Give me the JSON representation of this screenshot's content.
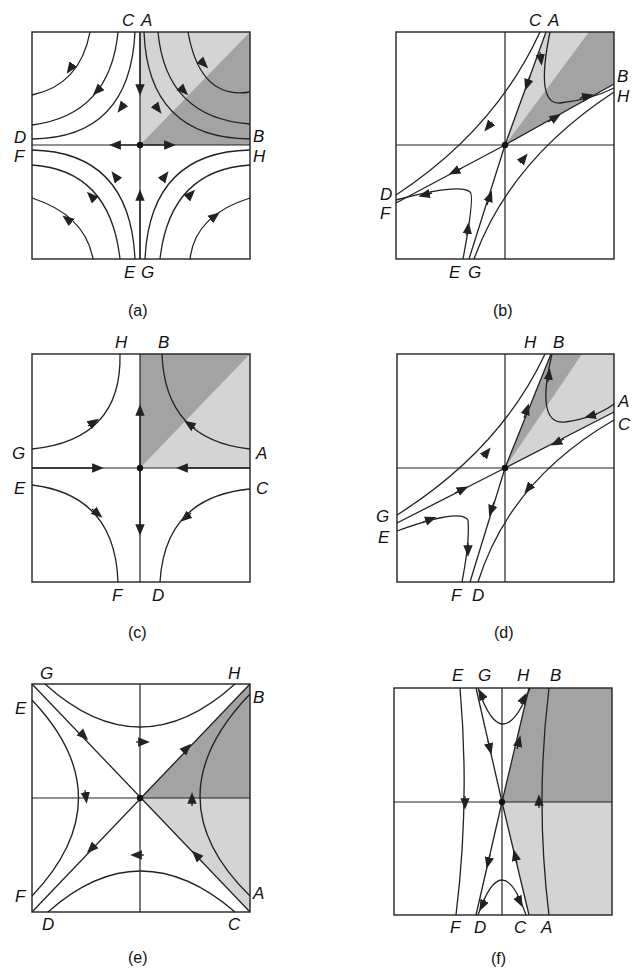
{
  "figure": {
    "panels": [
      {
        "id": "a",
        "caption": "(a)",
        "labels": {
          "top": [
            "C",
            "A"
          ],
          "left": [
            "D",
            "F"
          ],
          "right": [
            "B",
            "H"
          ],
          "bottom": [
            "E",
            "G"
          ]
        }
      },
      {
        "id": "b",
        "caption": "(b)",
        "labels": {
          "top": [
            "C",
            "A"
          ],
          "left": [
            "D",
            "F"
          ],
          "right": [
            "B",
            "H"
          ],
          "bottom": [
            "E",
            "G"
          ]
        }
      },
      {
        "id": "c",
        "caption": "(c)",
        "labels": {
          "top": [
            "H",
            "B"
          ],
          "left": [
            "G",
            "E"
          ],
          "right": [
            "A",
            "C"
          ],
          "bottom": [
            "F",
            "D"
          ]
        }
      },
      {
        "id": "d",
        "caption": "(d)",
        "labels": {
          "top": [
            "H",
            "B"
          ],
          "left": [
            "G",
            "E"
          ],
          "right": [
            "A",
            "C"
          ],
          "bottom": [
            "F",
            "D"
          ]
        }
      },
      {
        "id": "e",
        "caption": "(e)",
        "labels": {
          "top": [
            "G",
            "H"
          ],
          "left": [
            "E",
            "F"
          ],
          "right": [
            "B",
            "A"
          ],
          "bottom": [
            "D",
            "C"
          ]
        }
      },
      {
        "id": "f",
        "caption": "(f)",
        "labels": {
          "top": [
            "E",
            "G",
            "H",
            "B"
          ],
          "bottom": [
            "F",
            "D",
            "C",
            "A"
          ]
        }
      }
    ]
  },
  "colors": {
    "line": "#222222",
    "shade_light": "#d4d4d4",
    "shade_dark": "#a3a3a3",
    "background": "#ffffff"
  }
}
